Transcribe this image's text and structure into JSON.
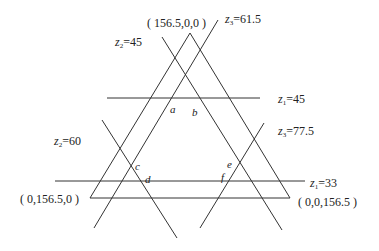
{
  "diagram": {
    "type": "ternary-constraint-lines",
    "vertices": {
      "top": "( 156.5,0,0 )",
      "bottom_left": "( 0,156.5,0 )",
      "bottom_right": "( 0,0,156.5 )"
    },
    "lines": [
      {
        "var": "z",
        "sub": "1",
        "value": "=45"
      },
      {
        "var": "z",
        "sub": "1",
        "value": "=33"
      },
      {
        "var": "z",
        "sub": "2",
        "value": "=45"
      },
      {
        "var": "z",
        "sub": "2",
        "value": "=60"
      },
      {
        "var": "z",
        "sub": "3",
        "value": "=61.5"
      },
      {
        "var": "z",
        "sub": "3",
        "value": "=77.5"
      }
    ],
    "points": [
      "a",
      "b",
      "c",
      "d",
      "e",
      "f"
    ],
    "stroke_color": "#333333"
  }
}
